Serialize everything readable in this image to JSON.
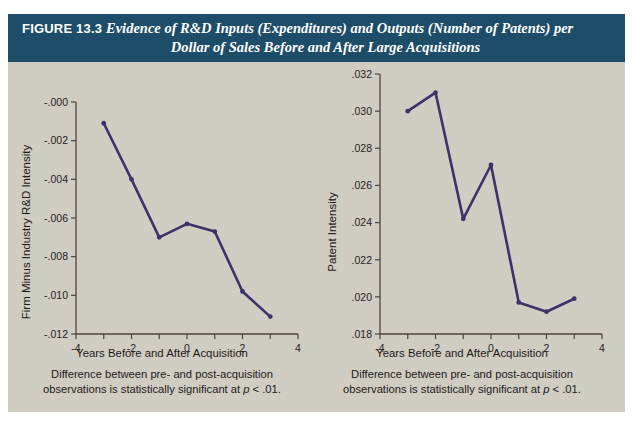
{
  "figure": {
    "label": "FIGURE 13.3",
    "title_line1": "Evidence of R&D Inputs (Expenditures) and Outputs (Number of Patents) per",
    "title_line2": "Dollar of Sales Before and After Large  Acquisitions",
    "header_bg": "#1d4d68",
    "panel_bg": "#d3d0c6",
    "line_color": "#3b3468"
  },
  "chart_data": [
    {
      "type": "line",
      "id": "rd-intensity",
      "title": "",
      "xlabel": "Years Before and After Acquisition",
      "ylabel": "Firm Minus Industry R&D Intensity",
      "x": [
        -3,
        -2,
        -1,
        0,
        1,
        2,
        3
      ],
      "values": [
        -0.0011,
        -0.004,
        -0.007,
        -0.0063,
        -0.0067,
        -0.0098,
        -0.0111
      ],
      "xlim": [
        -4,
        4
      ],
      "ylim": [
        -0.012,
        0.0
      ],
      "xticks": [
        -4,
        -3,
        -2,
        -1,
        0,
        1,
        2,
        3,
        4
      ],
      "xticklabels": [
        "-4",
        "",
        "-2",
        "",
        "0",
        "",
        "2",
        "",
        "4"
      ],
      "yticks": [
        0.0,
        -0.002,
        -0.004,
        -0.006,
        -0.008,
        -0.01,
        -0.012
      ],
      "yticklabels": [
        "-.000",
        "-.002",
        "-.004",
        "-.006",
        "-.008",
        "-.010",
        "-.012"
      ],
      "grid": false,
      "legend": "none",
      "caption_line1": "Difference between pre- and post-acquisition",
      "caption_line2_a": "observations is statistically significant at ",
      "caption_line2_p": "p",
      "caption_line2_b": " < .01."
    },
    {
      "type": "line",
      "id": "patent-intensity",
      "title": "",
      "xlabel": "Years Before and After Acquisition",
      "ylabel": "Patent Intensity",
      "x": [
        -3,
        -2,
        -1,
        0,
        1,
        2,
        3
      ],
      "values": [
        0.03,
        0.031,
        0.0242,
        0.0271,
        0.0197,
        0.0192,
        0.0199
      ],
      "xlim": [
        -4,
        4
      ],
      "ylim": [
        0.018,
        0.032
      ],
      "xticks": [
        -4,
        -3,
        -2,
        -1,
        0,
        1,
        2,
        3,
        4
      ],
      "xticklabels": [
        "-4",
        "",
        "-2",
        "",
        "0",
        "",
        "2",
        "",
        "4"
      ],
      "yticks": [
        0.032,
        0.03,
        0.028,
        0.026,
        0.024,
        0.022,
        0.02,
        0.018
      ],
      "yticklabels": [
        ".032",
        ".030",
        ".028",
        ".026",
        ".024",
        ".022",
        ".020",
        ".018"
      ],
      "grid": false,
      "legend": "none",
      "caption_line1": "Difference between pre- and post-acquisition",
      "caption_line2_a": "observations is statistically significant at ",
      "caption_line2_p": "p",
      "caption_line2_b": " < .01."
    }
  ]
}
